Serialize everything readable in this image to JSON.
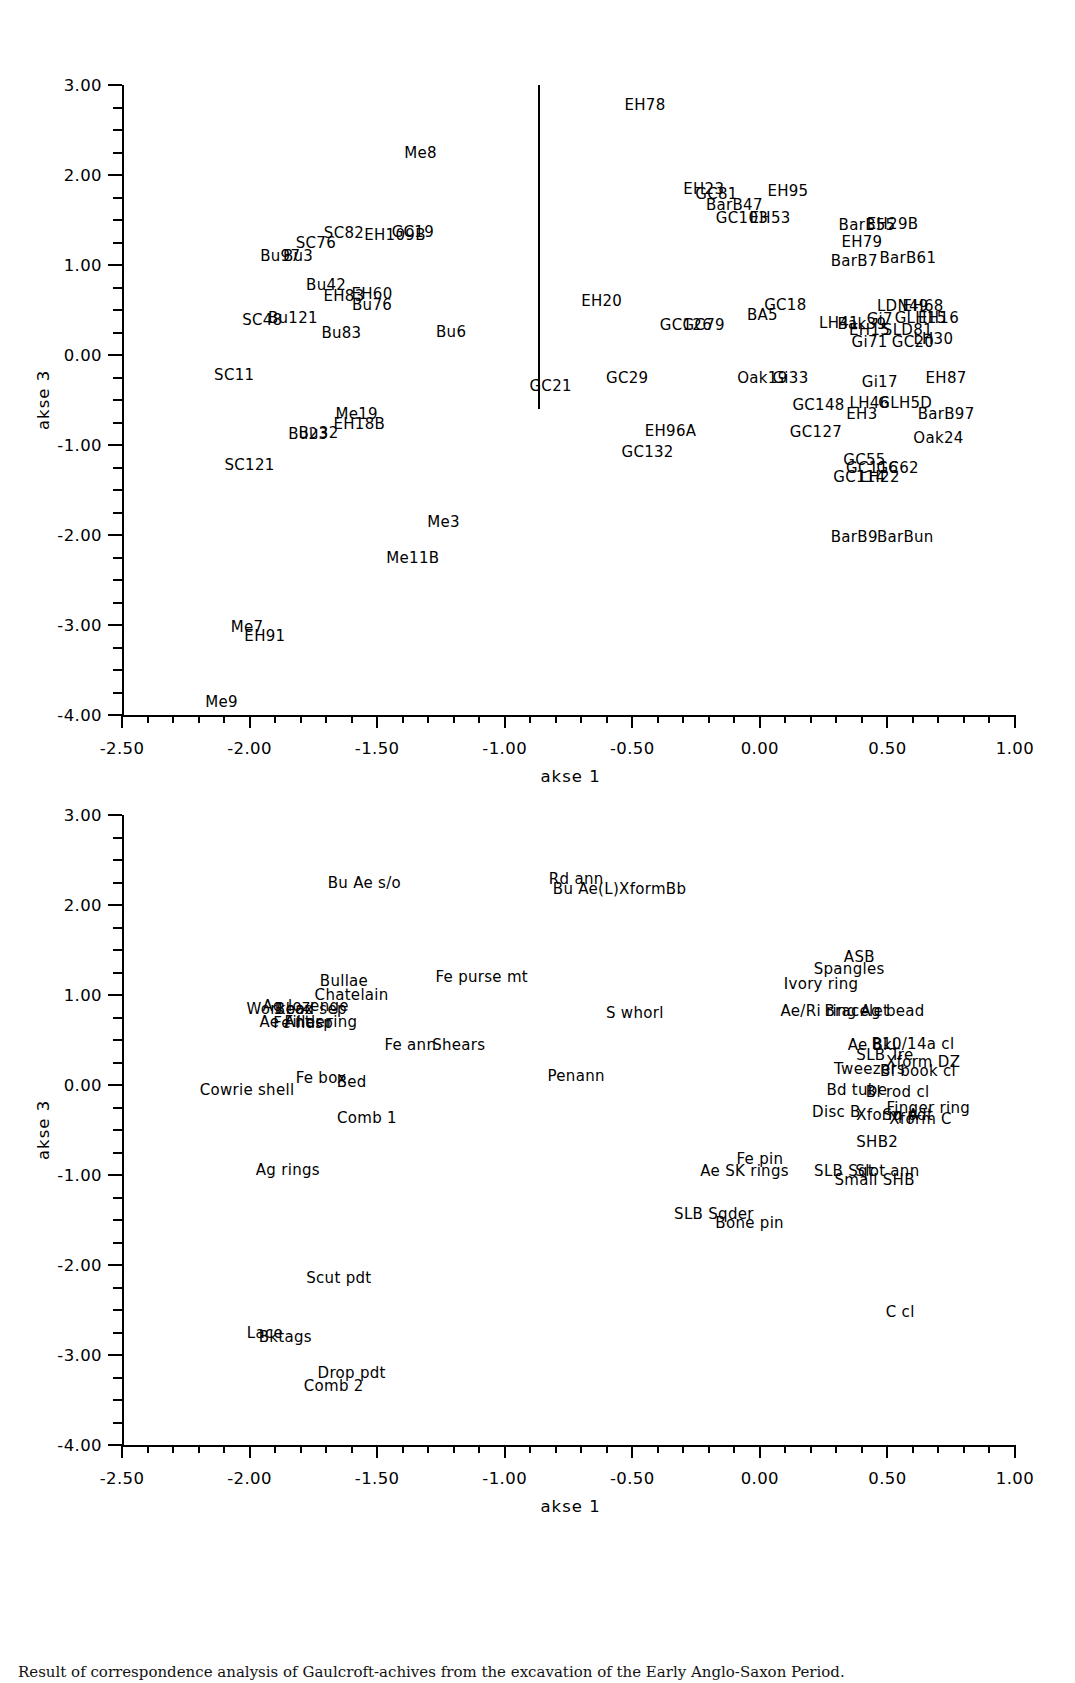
{
  "figure": {
    "caption": "Result of correspondence analysis of Gaulcroft-achives from the excavation of the Early Anglo-Saxon Period."
  },
  "chart_data": [
    {
      "id": "panel-1",
      "type": "scatter",
      "title": "",
      "xlabel": "akse 1",
      "ylabel": "akse 3",
      "xlim": [
        -2.5,
        1.0
      ],
      "ylim": [
        -4.0,
        3.0
      ],
      "xticks": [
        -2.5,
        -2.0,
        -1.5,
        -1.0,
        -0.5,
        0.0,
        0.5,
        1.0
      ],
      "xticklabels": [
        "-2.50",
        "-2.00",
        "-1.50",
        "-1.00",
        "-0.50",
        "0.00",
        "0.50",
        "1.00"
      ],
      "yticks": [
        -4.0,
        -3.0,
        -2.0,
        -1.0,
        0.0,
        1.0,
        2.0,
        3.0
      ],
      "yticklabels": [
        "-4.00",
        "-3.00",
        "-2.00",
        "-1.00",
        "0.00",
        "1.00",
        "2.00",
        "3.00"
      ],
      "x_minor_step": 0.1,
      "y_minor_step": 0.25,
      "grid": false,
      "legend": "none",
      "annotations": [
        {
          "kind": "vline",
          "x": -0.87,
          "y0": 3.0,
          "y1": -0.6
        }
      ],
      "points": [
        {
          "label": "EH78",
          "x": -0.45,
          "y": 2.78
        },
        {
          "label": "Me8",
          "x": -1.33,
          "y": 2.24
        },
        {
          "label": "EH23",
          "x": -0.22,
          "y": 1.85
        },
        {
          "label": "GC81",
          "x": -0.17,
          "y": 1.79
        },
        {
          "label": "EH95",
          "x": 0.11,
          "y": 1.82
        },
        {
          "label": "BarB47",
          "x": -0.1,
          "y": 1.67
        },
        {
          "label": "GC103",
          "x": -0.07,
          "y": 1.52
        },
        {
          "label": "EH53",
          "x": 0.04,
          "y": 1.52
        },
        {
          "label": "SC82",
          "x": -1.63,
          "y": 1.36
        },
        {
          "label": "EH109B",
          "x": -1.43,
          "y": 1.33
        },
        {
          "label": "GC19",
          "x": -1.36,
          "y": 1.37
        },
        {
          "label": "SC76",
          "x": -1.74,
          "y": 1.25
        },
        {
          "label": "BarB55",
          "x": 0.42,
          "y": 1.44
        },
        {
          "label": "EH29B",
          "x": 0.52,
          "y": 1.46
        },
        {
          "label": "EH79",
          "x": 0.4,
          "y": 1.26
        },
        {
          "label": "Bu97",
          "x": -1.88,
          "y": 1.1
        },
        {
          "label": "Bu3",
          "x": -1.81,
          "y": 1.1
        },
        {
          "label": "BarB7",
          "x": 0.37,
          "y": 1.05
        },
        {
          "label": "BarB61",
          "x": 0.58,
          "y": 1.08
        },
        {
          "label": "Bu42",
          "x": -1.7,
          "y": 0.78
        },
        {
          "label": "EH60",
          "x": -1.52,
          "y": 0.68
        },
        {
          "label": "EH83",
          "x": -1.63,
          "y": 0.66
        },
        {
          "label": "Bu76",
          "x": -1.52,
          "y": 0.56
        },
        {
          "label": "EH20",
          "x": -0.62,
          "y": 0.6
        },
        {
          "label": "GC18",
          "x": 0.1,
          "y": 0.56
        },
        {
          "label": "BA5",
          "x": 0.01,
          "y": 0.44
        },
        {
          "label": "LDN49",
          "x": 0.56,
          "y": 0.55
        },
        {
          "label": "EH68",
          "x": 0.64,
          "y": 0.55
        },
        {
          "label": "SC48",
          "x": -1.95,
          "y": 0.39
        },
        {
          "label": "Bu121",
          "x": -1.83,
          "y": 0.41
        },
        {
          "label": "GC126",
          "x": -0.29,
          "y": 0.33
        },
        {
          "label": "GC79",
          "x": -0.22,
          "y": 0.33
        },
        {
          "label": "LH41",
          "x": 0.31,
          "y": 0.36
        },
        {
          "label": "Bak39",
          "x": 0.4,
          "y": 0.35
        },
        {
          "label": "Gi7",
          "x": 0.47,
          "y": 0.4
        },
        {
          "label": "GLH15",
          "x": 0.63,
          "y": 0.41
        },
        {
          "label": "EH16",
          "x": 0.7,
          "y": 0.41
        },
        {
          "label": "EH15",
          "x": 0.43,
          "y": 0.28
        },
        {
          "label": "SLD81",
          "x": 0.58,
          "y": 0.28
        },
        {
          "label": "Bu83",
          "x": -1.64,
          "y": 0.25
        },
        {
          "label": "Bu6",
          "x": -1.21,
          "y": 0.26
        },
        {
          "label": "Gi71",
          "x": 0.43,
          "y": 0.14
        },
        {
          "label": "GC20",
          "x": 0.6,
          "y": 0.14
        },
        {
          "label": "LH30",
          "x": 0.68,
          "y": 0.18
        },
        {
          "label": "SC11",
          "x": -2.06,
          "y": -0.22
        },
        {
          "label": "GC21",
          "x": -0.82,
          "y": -0.34
        },
        {
          "label": "GC29",
          "x": -0.52,
          "y": -0.26
        },
        {
          "label": "Oak19",
          "x": 0.01,
          "y": -0.26
        },
        {
          "label": "Gi33",
          "x": 0.12,
          "y": -0.26
        },
        {
          "label": "Gi17",
          "x": 0.47,
          "y": -0.3
        },
        {
          "label": "EH87",
          "x": 0.73,
          "y": -0.25
        },
        {
          "label": "GC148",
          "x": 0.23,
          "y": -0.56
        },
        {
          "label": "LH46",
          "x": 0.43,
          "y": -0.53
        },
        {
          "label": "GLH5D",
          "x": 0.57,
          "y": -0.53
        },
        {
          "label": "EH3",
          "x": 0.4,
          "y": -0.65
        },
        {
          "label": "BarB97",
          "x": 0.73,
          "y": -0.66
        },
        {
          "label": "Me19",
          "x": -1.58,
          "y": -0.66
        },
        {
          "label": "EH18B",
          "x": -1.57,
          "y": -0.77
        },
        {
          "label": "EH96A",
          "x": -0.35,
          "y": -0.84
        },
        {
          "label": "GC127",
          "x": 0.22,
          "y": -0.86
        },
        {
          "label": "Oak24",
          "x": 0.7,
          "y": -0.92
        },
        {
          "label": "Bu23",
          "x": -1.77,
          "y": -0.88
        },
        {
          "label": "Bu32",
          "x": -1.73,
          "y": -0.87
        },
        {
          "label": "GC132",
          "x": -0.44,
          "y": -1.08
        },
        {
          "label": "GC55",
          "x": 0.41,
          "y": -1.17
        },
        {
          "label": "GC116",
          "x": 0.44,
          "y": -1.25
        },
        {
          "label": "GC62",
          "x": 0.54,
          "y": -1.25
        },
        {
          "label": "GC114",
          "x": 0.39,
          "y": -1.36
        },
        {
          "label": "LH22",
          "x": 0.47,
          "y": -1.36
        },
        {
          "label": "SC121",
          "x": -2.0,
          "y": -1.22
        },
        {
          "label": "Me3",
          "x": -1.24,
          "y": -1.86
        },
        {
          "label": "BarB9",
          "x": 0.37,
          "y": -2.02
        },
        {
          "label": "BarBun",
          "x": 0.57,
          "y": -2.02
        },
        {
          "label": "Me11B",
          "x": -1.36,
          "y": -2.26
        },
        {
          "label": "Me7",
          "x": -2.01,
          "y": -3.02
        },
        {
          "label": "EH91",
          "x": -1.94,
          "y": -3.12
        },
        {
          "label": "Me9",
          "x": -2.11,
          "y": -3.86
        }
      ]
    },
    {
      "id": "panel-2",
      "type": "scatter",
      "title": "",
      "xlabel": "akse 1",
      "ylabel": "akse 3",
      "xlim": [
        -2.5,
        1.0
      ],
      "ylim": [
        -4.0,
        3.0
      ],
      "xticks": [
        -2.5,
        -2.0,
        -1.5,
        -1.0,
        -0.5,
        0.0,
        0.5,
        1.0
      ],
      "xticklabels": [
        "-2.50",
        "-2.00",
        "-1.50",
        "-1.00",
        "-0.50",
        "0.00",
        "0.50",
        "1.00"
      ],
      "yticks": [
        -4.0,
        -3.0,
        -2.0,
        -1.0,
        0.0,
        1.0,
        2.0,
        3.0
      ],
      "yticklabels": [
        "-4.00",
        "-3.00",
        "-2.00",
        "-1.00",
        "0.00",
        "1.00",
        "2.00",
        "3.00"
      ],
      "x_minor_step": 0.1,
      "y_minor_step": 0.25,
      "grid": false,
      "legend": "none",
      "annotations": [],
      "points": [
        {
          "label": "Bu Ae s/o",
          "x": -1.55,
          "y": 2.24
        },
        {
          "label": "Rd ann",
          "x": -0.72,
          "y": 2.29
        },
        {
          "label": "Bu Ae(L)XformBb",
          "x": -0.55,
          "y": 2.18
        },
        {
          "label": "ASB",
          "x": 0.39,
          "y": 1.42
        },
        {
          "label": "Spangles",
          "x": 0.35,
          "y": 1.29
        },
        {
          "label": "Fe purse mt",
          "x": -1.09,
          "y": 1.2
        },
        {
          "label": "Bullae",
          "x": -1.63,
          "y": 1.16
        },
        {
          "label": "Ivory ring",
          "x": 0.24,
          "y": 1.12
        },
        {
          "label": "Chatelain",
          "x": -1.6,
          "y": 1.0
        },
        {
          "label": "Ag lozenge",
          "x": -1.78,
          "y": 0.88
        },
        {
          "label": "Workbox",
          "x": -1.88,
          "y": 0.84
        },
        {
          "label": "Bead sep",
          "x": -1.76,
          "y": 0.84
        },
        {
          "label": "S whorl",
          "x": -0.49,
          "y": 0.8
        },
        {
          "label": "Ae/Ri ring",
          "x": 0.23,
          "y": 0.82
        },
        {
          "label": "Bracelet",
          "x": 0.38,
          "y": 0.82
        },
        {
          "label": "Ag bead",
          "x": 0.52,
          "y": 0.82
        },
        {
          "label": "Ae Antler",
          "x": -1.82,
          "y": 0.7
        },
        {
          "label": "Fe hasp",
          "x": -1.79,
          "y": 0.69
        },
        {
          "label": "Filler ring",
          "x": -1.72,
          "y": 0.7
        },
        {
          "label": "Fe ann",
          "x": -1.37,
          "y": 0.44
        },
        {
          "label": "Shears",
          "x": -1.18,
          "y": 0.44
        },
        {
          "label": "Ae Bkl",
          "x": 0.44,
          "y": 0.44
        },
        {
          "label": "B10/14a cl",
          "x": 0.6,
          "y": 0.46
        },
        {
          "label": "SLB Tre",
          "x": 0.49,
          "y": 0.33
        },
        {
          "label": "Xform DZ",
          "x": 0.64,
          "y": 0.26
        },
        {
          "label": "Tweezers",
          "x": 0.43,
          "y": 0.18
        },
        {
          "label": "Bl book cl",
          "x": 0.62,
          "y": 0.16
        },
        {
          "label": "Penann",
          "x": -0.72,
          "y": 0.1
        },
        {
          "label": "Fe box",
          "x": -1.72,
          "y": 0.08
        },
        {
          "label": "Bed",
          "x": -1.6,
          "y": 0.03
        },
        {
          "label": "Bd tube",
          "x": 0.38,
          "y": -0.05
        },
        {
          "label": "Bl rod cl",
          "x": 0.54,
          "y": -0.08
        },
        {
          "label": "Cowrie shell",
          "x": -2.01,
          "y": -0.05
        },
        {
          "label": "Disc B",
          "x": 0.3,
          "y": -0.3
        },
        {
          "label": "Finger ring",
          "x": 0.66,
          "y": -0.26
        },
        {
          "label": "Xform A",
          "x": 0.5,
          "y": -0.33
        },
        {
          "label": "Sq pdt",
          "x": 0.58,
          "y": -0.33
        },
        {
          "label": "Xform C",
          "x": 0.63,
          "y": -0.38
        },
        {
          "label": "Comb 1",
          "x": -1.54,
          "y": -0.37
        },
        {
          "label": "SHB2",
          "x": 0.46,
          "y": -0.63
        },
        {
          "label": "Fe pin",
          "x": 0.0,
          "y": -0.82
        },
        {
          "label": "Ag rings",
          "x": -1.85,
          "y": -0.94
        },
        {
          "label": "Ae SK rings",
          "x": -0.06,
          "y": -0.95
        },
        {
          "label": "SLB Sqt",
          "x": 0.33,
          "y": -0.95
        },
        {
          "label": "Slot ann",
          "x": 0.5,
          "y": -0.95
        },
        {
          "label": "Small SHB",
          "x": 0.45,
          "y": -1.06
        },
        {
          "label": "SLB Sqder",
          "x": -0.18,
          "y": -1.43
        },
        {
          "label": "Bone pin",
          "x": -0.04,
          "y": -1.53
        },
        {
          "label": "Scut pdt",
          "x": -1.65,
          "y": -2.14
        },
        {
          "label": "C cl",
          "x": 0.55,
          "y": -2.52
        },
        {
          "label": "Lace",
          "x": -1.94,
          "y": -2.76
        },
        {
          "label": "Bktags",
          "x": -1.86,
          "y": -2.8
        },
        {
          "label": "Drop pdt",
          "x": -1.6,
          "y": -3.2
        },
        {
          "label": "Comb 2",
          "x": -1.67,
          "y": -3.34
        }
      ]
    }
  ]
}
